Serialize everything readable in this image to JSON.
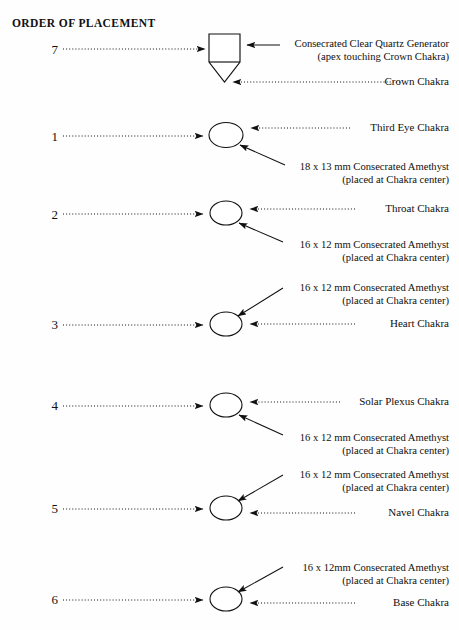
{
  "title": "ORDER OF PLACEMENT",
  "labels": {
    "quartz_line1": "Consecrated Clear Quartz Generator",
    "quartz_line2": "(apex touching Crown Chakra)",
    "crown": "Crown Chakra",
    "third_eye": "Third Eye Chakra",
    "third_eye_stone_line1": "18 x 13 mm Consecrated Amethyst",
    "third_eye_stone_line2": "(placed at Chakra center)",
    "throat": "Throat Chakra",
    "throat_stone_line1": "16 x 12 mm Consecrated Amethyst",
    "throat_stone_line2": "(placed at Chakra center)",
    "heart": "Heart Chakra",
    "heart_stone_line1": "16 x 12 mm Consecrated Amethyst",
    "heart_stone_line2": "(placed at Chakra center)",
    "solar_plexus": "Solar Plexus Chakra",
    "solar_plexus_stone_line1": "16 x 12 mm Consecrated Amethyst",
    "solar_plexus_stone_line2": "(placed at Chakra center)",
    "navel": "Navel Chakra",
    "navel_stone_line1": "16 x 12 mm Consecrated Amethyst",
    "navel_stone_line2": "(placed at Chakra center)",
    "base": "Base Chakra",
    "base_stone_line1": "16 x 12mm Consecrated Amethyst",
    "base_stone_line2": "(placed at Chakra center)"
  },
  "order_numbers": {
    "crown": "7",
    "third_eye": "1",
    "throat": "2",
    "heart": "3",
    "solar_plexus": "4",
    "navel": "5",
    "base": "6"
  },
  "colors": {
    "ink": "#101010",
    "background": "#fefefe"
  }
}
